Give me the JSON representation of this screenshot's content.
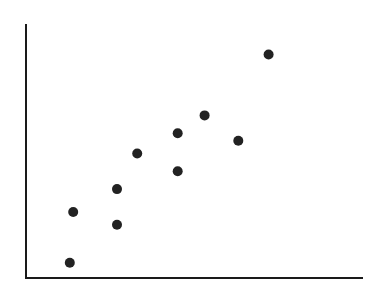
{
  "chart_data": {
    "type": "scatter",
    "title": "",
    "xlabel": "",
    "ylabel": "",
    "xlim": [
      0,
      10
    ],
    "ylim": [
      0,
      10
    ],
    "grid": false,
    "legend": null,
    "series": [
      {
        "name": "points",
        "color": "#222222",
        "points": [
          {
            "x": 1.3,
            "y": 0.6
          },
          {
            "x": 1.4,
            "y": 2.6
          },
          {
            "x": 2.7,
            "y": 2.1
          },
          {
            "x": 2.7,
            "y": 3.5
          },
          {
            "x": 3.3,
            "y": 4.9
          },
          {
            "x": 4.5,
            "y": 4.2
          },
          {
            "x": 4.5,
            "y": 5.7
          },
          {
            "x": 5.3,
            "y": 6.4
          },
          {
            "x": 6.3,
            "y": 5.4
          },
          {
            "x": 7.2,
            "y": 8.8
          }
        ]
      }
    ]
  },
  "axes": {
    "color": "#1a1a1a",
    "show_ticks": false
  }
}
